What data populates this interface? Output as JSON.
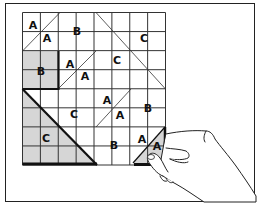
{
  "figure": {
    "type": "quilt-block-piecing-illustration",
    "grid": {
      "columns": 8,
      "rows": 8
    },
    "labels": [
      {
        "text": "A",
        "x": 33,
        "y": 29
      },
      {
        "text": "A",
        "x": 47,
        "y": 42
      },
      {
        "text": "B",
        "x": 77,
        "y": 35
      },
      {
        "text": "C",
        "x": 144,
        "y": 42
      },
      {
        "text": "B",
        "x": 41,
        "y": 75
      },
      {
        "text": "A",
        "x": 70,
        "y": 68
      },
      {
        "text": "A",
        "x": 85,
        "y": 80
      },
      {
        "text": "C",
        "x": 117,
        "y": 64
      },
      {
        "text": "A",
        "x": 107,
        "y": 104
      },
      {
        "text": "A",
        "x": 120,
        "y": 119
      },
      {
        "text": "C",
        "x": 74,
        "y": 118
      },
      {
        "text": "B",
        "x": 148,
        "y": 112
      },
      {
        "text": "C",
        "x": 46,
        "y": 142
      },
      {
        "text": "B",
        "x": 114,
        "y": 149
      },
      {
        "text": "A",
        "x": 142,
        "y": 143
      },
      {
        "text": "A",
        "x": 157,
        "y": 150
      }
    ],
    "colors": {
      "line": "#222222",
      "shade": "#d6d6d6",
      "background": "#ffffff"
    }
  }
}
